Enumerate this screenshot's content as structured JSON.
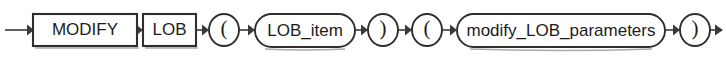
{
  "diagram": {
    "kind": "railroad-syntax-diagram",
    "background_color": "#ffffff",
    "line_color": "#3a3a3a",
    "stroke_color": "#2e2e2e",
    "text_color": "#1c1c1c",
    "baseline_y": 30,
    "entry": {
      "name": "entry-arrow",
      "x1": 5,
      "x2": 33
    },
    "exit": {
      "name": "exit-arrow",
      "x1": 710,
      "x2": 723
    },
    "nodes": [
      {
        "id": "modify",
        "shape": "box",
        "label": "MODIFY",
        "kind": "keyword",
        "x": 33,
        "y": 14,
        "width": 104,
        "height": 32
      },
      {
        "id": "lob",
        "shape": "box",
        "label": "LOB",
        "kind": "keyword",
        "x": 143,
        "y": 14,
        "width": 53,
        "height": 32
      },
      {
        "id": "lparen-1",
        "shape": "circle",
        "label": "(",
        "kind": "punctuation",
        "cx": 224,
        "cy": 30,
        "rx": 15,
        "ry": 16
      },
      {
        "id": "lob-item",
        "shape": "stadium",
        "label": "LOB_item",
        "kind": "nonterminal",
        "x": 255,
        "y": 14,
        "width": 100,
        "height": 33
      },
      {
        "id": "rparen-1",
        "shape": "circle",
        "label": ")",
        "kind": "punctuation",
        "cx": 383,
        "cy": 30,
        "rx": 15,
        "ry": 16
      },
      {
        "id": "lparen-2",
        "shape": "circle",
        "label": "(",
        "kind": "punctuation",
        "cx": 427,
        "cy": 30,
        "rx": 15,
        "ry": 16
      },
      {
        "id": "modify-lob-parameters",
        "shape": "stadium",
        "label": "modify_LOB_parameters",
        "kind": "nonterminal",
        "x": 457,
        "y": 14,
        "width": 208,
        "height": 33
      },
      {
        "id": "rparen-2",
        "shape": "circle",
        "label": ")",
        "kind": "punctuation",
        "cx": 695,
        "cy": 30,
        "rx": 15,
        "ry": 16
      }
    ],
    "connectors": [
      {
        "id": "conn-modify-lob",
        "x1": 137,
        "x2": 143
      },
      {
        "id": "conn-lob-lparen1",
        "x1": 196,
        "x2": 209
      },
      {
        "id": "conn-lparen1-lobitem",
        "x1": 239,
        "x2": 255
      },
      {
        "id": "conn-lobitem-rparen1",
        "x1": 355,
        "x2": 368
      },
      {
        "id": "conn-rparen1-lparen2",
        "x1": 398,
        "x2": 412
      },
      {
        "id": "conn-lparen2-params",
        "x1": 442,
        "x2": 457
      },
      {
        "id": "conn-params-rparen2",
        "x1": 665,
        "x2": 680
      }
    ]
  }
}
